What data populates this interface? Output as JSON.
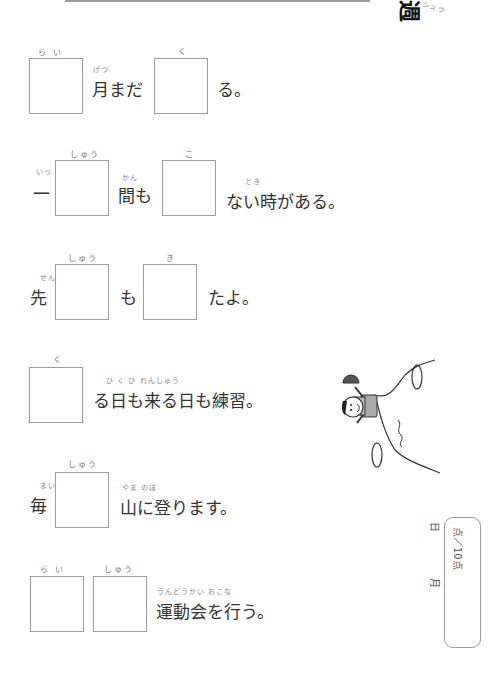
{
  "worksheet": {
    "title_kanji": "週",
    "title_ruby": "シュウ",
    "rows": [
      {
        "id": "row-1",
        "boxes": [
          {
            "ruby": "ら い"
          },
          {
            "ruby": "く"
          }
        ],
        "text_between": "月まだ",
        "text_between_ruby": "げつ",
        "text_after": "る。"
      },
      {
        "id": "row-2",
        "prefix": "一",
        "prefix_ruby": "いっ",
        "boxes": [
          {
            "ruby": "しゅう"
          },
          {
            "ruby": "こ"
          }
        ],
        "text_between": "間も",
        "text_between_ruby": "かん",
        "text_after": "ない時がある。",
        "text_after_ruby": "とき"
      },
      {
        "id": "row-3",
        "prefix": "先",
        "prefix_ruby": "せん",
        "boxes": [
          {
            "ruby": "しゅう"
          },
          {
            "ruby": "き"
          }
        ],
        "text_between": "も",
        "text_after": "たよ。"
      },
      {
        "id": "row-4",
        "boxes": [
          {
            "ruby": "く"
          }
        ],
        "text_after": "る日も来る日も練習。",
        "text_after_ruby": "ひ   く  ひ  れんしゅう"
      },
      {
        "id": "row-5",
        "prefix": "毎",
        "prefix_ruby": "まい",
        "boxes": [
          {
            "ruby": "しゅう"
          }
        ],
        "text_after": "山に登ります。",
        "text_after_ruby": "やま  のぼ"
      },
      {
        "id": "row-6",
        "boxes": [
          {
            "ruby": "ら い"
          },
          {
            "ruby": "しゅう"
          }
        ],
        "text_after": "運動会を行う。",
        "text_after_ruby": "うんどうかい  おこな"
      }
    ],
    "score": {
      "month_label": "月",
      "day_label": "日",
      "points_label": "点",
      "max_label": "／10点"
    },
    "illustration": {
      "description": "boy-waving-cap-on-mountain"
    }
  }
}
